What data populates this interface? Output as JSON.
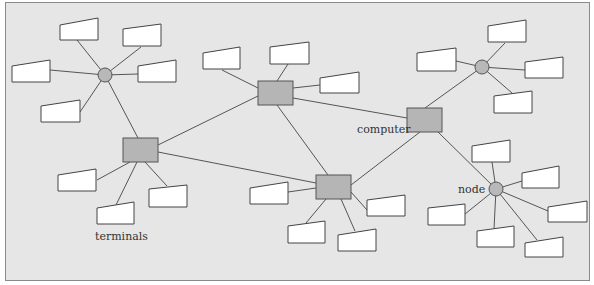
{
  "diagram": {
    "type": "network-topology",
    "labels": {
      "terminals": "terminals",
      "computer": "computer",
      "node": "node"
    },
    "colors": {
      "background": "#e6e6e6",
      "computer_fill": "#b5b5b5",
      "node_fill": "#b8b8b8",
      "terminal_fill": "#ffffff",
      "stroke": "#555555"
    },
    "computers": [
      {
        "id": "c1",
        "x": 123,
        "y": 138,
        "w": 35,
        "h": 24
      },
      {
        "id": "c2",
        "x": 258,
        "y": 81,
        "w": 35,
        "h": 24
      },
      {
        "id": "c3",
        "x": 407,
        "y": 108,
        "w": 35,
        "h": 24
      },
      {
        "id": "c4",
        "x": 316,
        "y": 175,
        "w": 35,
        "h": 24
      }
    ],
    "nodes": [
      {
        "id": "n1",
        "x": 105,
        "y": 75,
        "r": 7
      },
      {
        "id": "n2",
        "x": 482,
        "y": 67,
        "r": 7
      },
      {
        "id": "n3",
        "x": 496,
        "y": 189,
        "r": 7
      }
    ]
  }
}
